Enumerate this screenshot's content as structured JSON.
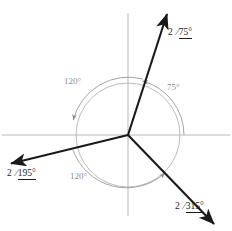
{
  "diagram": {
    "type": "phasor-diagram",
    "title": "",
    "origin": {
      "x": 128,
      "y": 135
    },
    "axes": {
      "color": "#b9b9b9",
      "horizontal": {
        "x1": 2,
        "y1": 135,
        "x2": 230,
        "y2": 135
      },
      "vertical": {
        "x1": 128,
        "y1": 13,
        "x2": 128,
        "y2": 216
      }
    },
    "reference_circle": {
      "radius": 52,
      "color": "#b4b4b4"
    },
    "phasors": [
      {
        "name": "phasor-75",
        "magnitude": "2",
        "angle_deg": 75,
        "angle_text": "75°",
        "label": "2 /75°",
        "color": "#1a1a1a",
        "tip": {
          "x": 167,
          "y": 13
        },
        "label_pos": {
          "x": 168,
          "y": 27
        }
      },
      {
        "name": "phasor-195",
        "magnitude": "2",
        "angle_deg": 195,
        "angle_text": "195°",
        "label": "2 /195°",
        "color": "#1a1a1a",
        "tip": {
          "x": 9,
          "y": 164
        },
        "label_pos": {
          "x": 7,
          "y": 168
        }
      },
      {
        "name": "phasor-315",
        "magnitude": "2",
        "angle_deg": 315,
        "angle_text": "315°",
        "label": "2 /315°",
        "color": "#1a1a1a",
        "tip": {
          "x": 216,
          "y": 226
        },
        "label_pos": {
          "x": 175,
          "y": 201
        }
      }
    ],
    "arc_annotations": [
      {
        "name": "arc-75",
        "text": "75°",
        "from_deg": 0,
        "to_deg": 75,
        "color": "#8e8e8e",
        "label_pos": {
          "x": 167,
          "y": 82
        }
      },
      {
        "name": "arc-120-upper",
        "text": "120°",
        "from_deg": 75,
        "to_deg": 195,
        "color": "#8e8e8e",
        "label_pos": {
          "x": 64,
          "y": 76
        }
      },
      {
        "name": "arc-120-lower",
        "text": "120°",
        "from_deg": 195,
        "to_deg": 315,
        "color": "#8e8e8e",
        "label_pos": {
          "x": 70,
          "y": 171
        }
      }
    ]
  }
}
